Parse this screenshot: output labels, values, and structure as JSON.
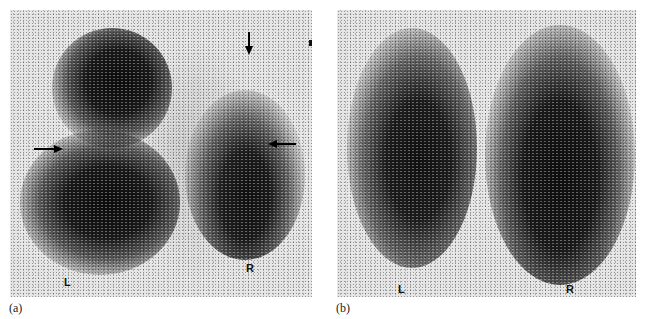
{
  "figure": {
    "panels": [
      {
        "id": "a",
        "caption": "(a)",
        "side_labels": {
          "left": "L",
          "right": "R"
        },
        "arrows": [
          {
            "direction": "right",
            "position": "left lung mid-zone"
          },
          {
            "direction": "left",
            "position": "right lung mid-zone"
          },
          {
            "direction": "down",
            "position": "above right lung apex"
          }
        ]
      },
      {
        "id": "b",
        "caption": "(b)",
        "side_labels": {
          "left": "L",
          "right": "R"
        },
        "arrows": []
      }
    ],
    "colors": {
      "background": "#e4e4e4",
      "uptake": "#111111",
      "page": "#ffffff"
    }
  }
}
